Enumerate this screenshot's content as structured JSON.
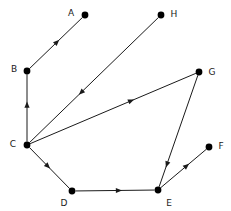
{
  "diagram": {
    "width": 231,
    "height": 211,
    "background_color": "#ffffff",
    "node_color": "#000000",
    "edge_color": "#1a1a1a",
    "label_color": "#1a1a1a",
    "node_radius": 3.4,
    "nodes": [
      {
        "id": "A",
        "label": "A",
        "x": 85,
        "y": 15,
        "label_x": 71,
        "label_y": 13,
        "label_anchor": "middle"
      },
      {
        "id": "B",
        "label": "B",
        "x": 27,
        "y": 71,
        "label_x": 14,
        "label_y": 69,
        "label_anchor": "middle"
      },
      {
        "id": "C",
        "label": "C",
        "x": 27,
        "y": 145,
        "label_x": 13,
        "label_y": 144,
        "label_anchor": "middle"
      },
      {
        "id": "D",
        "label": "D",
        "x": 72,
        "y": 191,
        "label_x": 64,
        "label_y": 203,
        "label_anchor": "middle"
      },
      {
        "id": "E",
        "label": "E",
        "x": 158,
        "y": 190,
        "label_x": 169,
        "label_y": 203,
        "label_anchor": "middle"
      },
      {
        "id": "F",
        "label": "F",
        "x": 209,
        "y": 147,
        "label_x": 221,
        "label_y": 146,
        "label_anchor": "middle"
      },
      {
        "id": "G",
        "label": "G",
        "x": 199,
        "y": 72,
        "label_x": 212,
        "label_y": 72,
        "label_anchor": "middle"
      },
      {
        "id": "H",
        "label": "H",
        "x": 161,
        "y": 15,
        "label_x": 174,
        "label_y": 14,
        "label_anchor": "middle"
      }
    ],
    "edges": [
      {
        "id": "B-A",
        "from": "B",
        "to": "A",
        "directed": true,
        "arrow_t": 0.52
      },
      {
        "id": "C-B",
        "from": "C",
        "to": "B",
        "directed": true,
        "arrow_t": 0.55
      },
      {
        "id": "H-C",
        "from": "H",
        "to": "C",
        "directed": true,
        "arrow_t": 0.6
      },
      {
        "id": "C-G",
        "from": "C",
        "to": "G",
        "directed": true,
        "arrow_t": 0.61
      },
      {
        "id": "C-D",
        "from": "C",
        "to": "D",
        "directed": true,
        "arrow_t": 0.46
      },
      {
        "id": "D-E",
        "from": "D",
        "to": "E",
        "directed": true,
        "arrow_t": 0.55
      },
      {
        "id": "G-E",
        "from": "G",
        "to": "E",
        "directed": true,
        "arrow_t": 0.8
      },
      {
        "id": "E-F",
        "from": "E",
        "to": "F",
        "directed": true,
        "arrow_t": 0.57
      }
    ]
  }
}
